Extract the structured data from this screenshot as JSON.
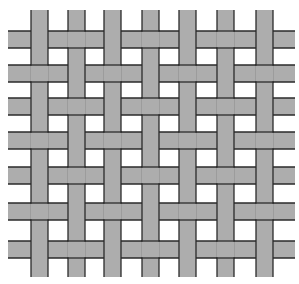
{
  "figure": {
    "canvas": {
      "width": 299,
      "height": 284,
      "background": "#ffffff"
    },
    "strip_fill": "#adadad",
    "edge_color": "#2a2a2a",
    "strip_width": 17,
    "horizontal_strips": {
      "x_start": 8,
      "x_end": 295,
      "y_positions": [
        31,
        65,
        98,
        132,
        167,
        203,
        241
      ]
    },
    "vertical_strips": {
      "y_start": 10,
      "y_end": 277,
      "x_positions": [
        31,
        68,
        104,
        142,
        179,
        217,
        256
      ]
    },
    "weave_rule": "vertical over horizontal when (row+col) is even (1-indexed)"
  }
}
